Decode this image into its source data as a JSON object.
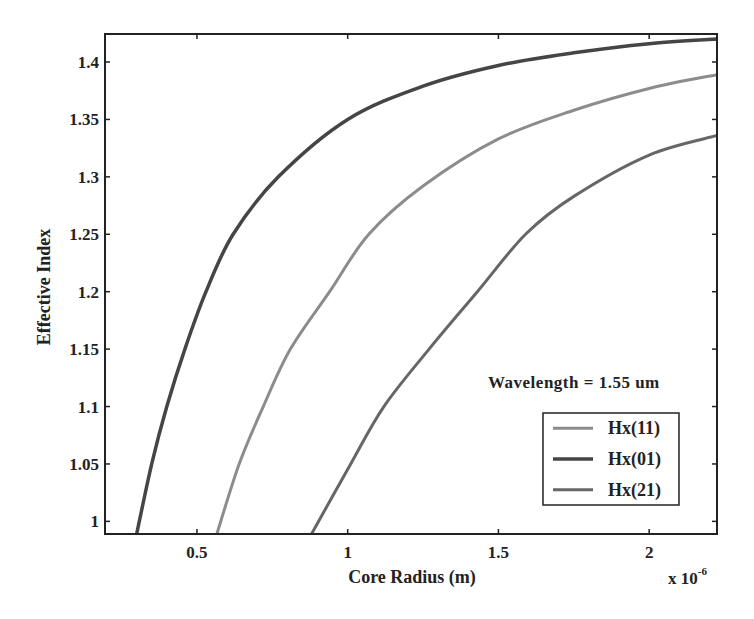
{
  "chart_data": {
    "type": "line",
    "title": "",
    "xlabel": "Core Radius (m)",
    "ylabel": "Effective Index",
    "x_multiplier_label": "x 10",
    "x_multiplier_exponent": "-6",
    "xlim": [
      0.195,
      2.225
    ],
    "ylim": [
      0.989,
      1.4244
    ],
    "xticks": [
      0.5,
      1,
      1.5,
      2
    ],
    "xtick_labels": [
      "0.5",
      "1",
      "1.5",
      "2"
    ],
    "yticks": [
      1,
      1.05,
      1.1,
      1.15,
      1.2,
      1.25,
      1.3,
      1.35,
      1.4
    ],
    "ytick_labels": [
      "1",
      "1.05",
      "1.1",
      "1.15",
      "1.2",
      "1.25",
      "1.3",
      "1.35",
      "1.4"
    ],
    "grid": false,
    "annotation": "Wavelength = 1.55 um",
    "legend_position": "lower right",
    "series": [
      {
        "name": "Hx(11)",
        "color": "#8c8c8c",
        "width": 3,
        "x": [
          0.566,
          0.64,
          0.72,
          0.81,
          0.94,
          1.07,
          1.25,
          1.5,
          1.75,
          2.0,
          2.225
        ],
        "y": [
          0.989,
          1.05,
          1.1,
          1.15,
          1.2,
          1.25,
          1.292,
          1.333,
          1.358,
          1.377,
          1.389
        ]
      },
      {
        "name": "Hx(01)",
        "color": "#454545",
        "width": 3.5,
        "x": [
          0.3,
          0.35,
          0.4,
          0.46,
          0.53,
          0.62,
          0.77,
          1.0,
          1.25,
          1.5,
          1.75,
          2.0,
          2.225
        ],
        "y": [
          0.989,
          1.05,
          1.1,
          1.15,
          1.2,
          1.25,
          1.3,
          1.35,
          1.379,
          1.397,
          1.408,
          1.416,
          1.42
        ]
      },
      {
        "name": "Hx(21)",
        "color": "#666666",
        "width": 3,
        "x": [
          0.88,
          1.01,
          1.12,
          1.27,
          1.43,
          1.59,
          1.75,
          2.0,
          2.225
        ],
        "y": [
          0.989,
          1.05,
          1.1,
          1.15,
          1.2,
          1.25,
          1.283,
          1.319,
          1.336
        ]
      }
    ]
  },
  "layout": {
    "plot": {
      "left": 105,
      "top": 34,
      "right": 717,
      "bottom": 534
    },
    "legend_box": {
      "left": 543,
      "top": 413,
      "right": 679,
      "bottom": 505
    }
  }
}
